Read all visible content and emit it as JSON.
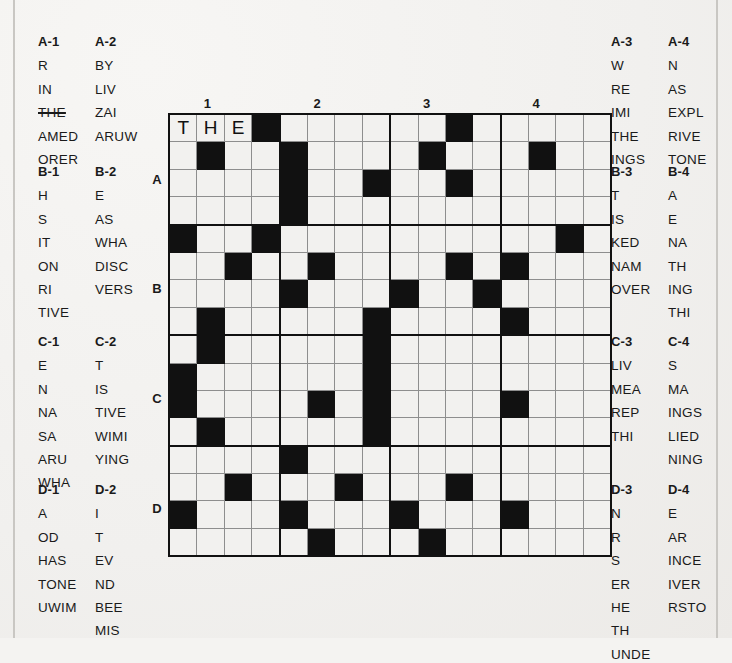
{
  "puzzle": {
    "title": "crossword-fragment-puzzle",
    "grid": {
      "rows": 16,
      "cols": 16,
      "section_size": 4,
      "col_labels": [
        "1",
        "2",
        "3",
        "4"
      ],
      "row_labels": [
        "A",
        "B",
        "C",
        "D"
      ],
      "col_label_at_col": [
        2,
        6,
        10,
        14
      ],
      "row_label_at_row": [
        3,
        7,
        11,
        15
      ],
      "entered_letters": [
        {
          "row": 1,
          "col": 1,
          "letter": "T"
        },
        {
          "row": 1,
          "col": 2,
          "letter": "H"
        },
        {
          "row": 1,
          "col": 3,
          "letter": "E"
        }
      ],
      "black_cells": [
        [
          1,
          4
        ],
        [
          1,
          11
        ],
        [
          2,
          2
        ],
        [
          2,
          5
        ],
        [
          2,
          10
        ],
        [
          2,
          14
        ],
        [
          3,
          5
        ],
        [
          3,
          8
        ],
        [
          3,
          11
        ],
        [
          4,
          5
        ],
        [
          5,
          1
        ],
        [
          5,
          4
        ],
        [
          5,
          15
        ],
        [
          6,
          3
        ],
        [
          6,
          6
        ],
        [
          6,
          11
        ],
        [
          6,
          13
        ],
        [
          7,
          5
        ],
        [
          7,
          9
        ],
        [
          7,
          12
        ],
        [
          8,
          2
        ],
        [
          8,
          8
        ],
        [
          8,
          13
        ],
        [
          9,
          2
        ],
        [
          9,
          8
        ],
        [
          10,
          1
        ],
        [
          10,
          8
        ],
        [
          11,
          1
        ],
        [
          11,
          6
        ],
        [
          11,
          8
        ],
        [
          11,
          13
        ],
        [
          12,
          2
        ],
        [
          12,
          8
        ],
        [
          13,
          5
        ],
        [
          14,
          3
        ],
        [
          14,
          7
        ],
        [
          14,
          11
        ],
        [
          15,
          1
        ],
        [
          15,
          5
        ],
        [
          15,
          9
        ],
        [
          15,
          13
        ],
        [
          16,
          6
        ],
        [
          16,
          10
        ]
      ]
    },
    "clue_groups": [
      {
        "id": "A-1",
        "side": "left",
        "col": 1,
        "items": [
          {
            "text": "R",
            "used": false
          },
          {
            "text": "IN",
            "used": false
          },
          {
            "text": "THE",
            "used": true
          },
          {
            "text": "AMED",
            "used": false
          },
          {
            "text": "ORER",
            "used": false
          }
        ]
      },
      {
        "id": "A-2",
        "side": "left",
        "col": 2,
        "items": [
          {
            "text": "BY",
            "used": false
          },
          {
            "text": "LIV",
            "used": false
          },
          {
            "text": "ZAI",
            "used": false
          },
          {
            "text": "ARUW",
            "used": false
          }
        ]
      },
      {
        "id": "A-3",
        "side": "right",
        "col": 1,
        "items": [
          {
            "text": "W",
            "used": false
          },
          {
            "text": "RE",
            "used": false
          },
          {
            "text": "IMI",
            "used": false
          },
          {
            "text": "THE",
            "used": false
          },
          {
            "text": "INGS",
            "used": false
          }
        ]
      },
      {
        "id": "A-4",
        "side": "right",
        "col": 2,
        "items": [
          {
            "text": "N",
            "used": false
          },
          {
            "text": "AS",
            "used": false
          },
          {
            "text": "EXPL",
            "used": false
          },
          {
            "text": "RIVE",
            "used": false
          },
          {
            "text": "TONE",
            "used": false
          }
        ]
      },
      {
        "id": "B-1",
        "side": "left",
        "col": 1,
        "items": [
          {
            "text": "H",
            "used": false
          },
          {
            "text": "S",
            "used": false
          },
          {
            "text": "IT",
            "used": false
          },
          {
            "text": "ON",
            "used": false
          },
          {
            "text": "RI",
            "used": false
          },
          {
            "text": "TIVE",
            "used": false
          }
        ]
      },
      {
        "id": "B-2",
        "side": "left",
        "col": 2,
        "items": [
          {
            "text": "E",
            "used": false
          },
          {
            "text": "AS",
            "used": false
          },
          {
            "text": "WHA",
            "used": false
          },
          {
            "text": "DISC",
            "used": false
          },
          {
            "text": "VERS",
            "used": false
          }
        ]
      },
      {
        "id": "B-3",
        "side": "right",
        "col": 1,
        "items": [
          {
            "text": "T",
            "used": false
          },
          {
            "text": "IS",
            "used": false
          },
          {
            "text": "KED",
            "used": false
          },
          {
            "text": "NAM",
            "used": false
          },
          {
            "text": "OVER",
            "used": false
          }
        ]
      },
      {
        "id": "B-4",
        "side": "right",
        "col": 2,
        "items": [
          {
            "text": "A",
            "used": false
          },
          {
            "text": "E",
            "used": false
          },
          {
            "text": "NA",
            "used": false
          },
          {
            "text": "TH",
            "used": false
          },
          {
            "text": "ING",
            "used": false
          },
          {
            "text": "THI",
            "used": false
          }
        ]
      },
      {
        "id": "C-1",
        "side": "left",
        "col": 1,
        "items": [
          {
            "text": "E",
            "used": false
          },
          {
            "text": "N",
            "used": false
          },
          {
            "text": "NA",
            "used": false
          },
          {
            "text": "SA",
            "used": false
          },
          {
            "text": "ARU",
            "used": false
          },
          {
            "text": "WHA",
            "used": false
          }
        ]
      },
      {
        "id": "C-2",
        "side": "left",
        "col": 2,
        "items": [
          {
            "text": "T",
            "used": false
          },
          {
            "text": "IS",
            "used": false
          },
          {
            "text": "TIVE",
            "used": false
          },
          {
            "text": "WIMI",
            "used": false
          },
          {
            "text": "YING",
            "used": false
          }
        ]
      },
      {
        "id": "C-3",
        "side": "right",
        "col": 1,
        "items": [
          {
            "text": "LIV",
            "used": false
          },
          {
            "text": "MEA",
            "used": false
          },
          {
            "text": "REP",
            "used": false
          },
          {
            "text": "THI",
            "used": false
          }
        ]
      },
      {
        "id": "C-4",
        "side": "right",
        "col": 2,
        "items": [
          {
            "text": "S",
            "used": false
          },
          {
            "text": "MA",
            "used": false
          },
          {
            "text": "INGS",
            "used": false
          },
          {
            "text": "LIED",
            "used": false
          },
          {
            "text": "NING",
            "used": false
          }
        ]
      },
      {
        "id": "D-1",
        "side": "left",
        "col": 1,
        "items": [
          {
            "text": "A",
            "used": false
          },
          {
            "text": "OD",
            "used": false
          },
          {
            "text": "HAS",
            "used": false
          },
          {
            "text": "TONE",
            "used": false
          },
          {
            "text": "UWIM",
            "used": false
          }
        ]
      },
      {
        "id": "D-2",
        "side": "left",
        "col": 2,
        "items": [
          {
            "text": "I",
            "used": false
          },
          {
            "text": "T",
            "used": false
          },
          {
            "text": "EV",
            "used": false
          },
          {
            "text": "ND",
            "used": false
          },
          {
            "text": "BEE",
            "used": false
          },
          {
            "text": "MIS",
            "used": false
          }
        ]
      },
      {
        "id": "D-3",
        "side": "right",
        "col": 1,
        "items": [
          {
            "text": "N",
            "used": false
          },
          {
            "text": "R",
            "used": false
          },
          {
            "text": "S",
            "used": false
          },
          {
            "text": "ER",
            "used": false
          },
          {
            "text": "HE",
            "used": false
          },
          {
            "text": "TH",
            "used": false
          },
          {
            "text": "UNDE",
            "used": false
          }
        ]
      },
      {
        "id": "D-4",
        "side": "right",
        "col": 2,
        "items": [
          {
            "text": "E",
            "used": false
          },
          {
            "text": "AR",
            "used": false
          },
          {
            "text": "INCE",
            "used": false
          },
          {
            "text": "IVER",
            "used": false
          },
          {
            "text": "RSTO",
            "used": false
          }
        ]
      }
    ]
  },
  "colors": {
    "paper": "#f2f1ef",
    "ink": "#111111",
    "cell_border": "#8e8e8e"
  }
}
